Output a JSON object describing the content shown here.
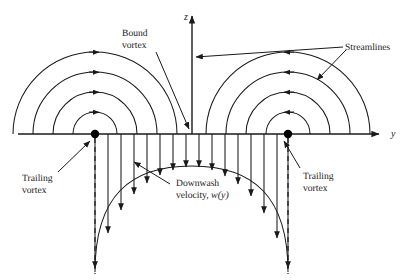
{
  "figure": {
    "background_color": "#ffffff",
    "line_color": "#1a1a1a",
    "width": 412,
    "height": 280
  },
  "axes": {
    "horizontal": {
      "name": "y-axis",
      "label": "y",
      "label_x": 391,
      "label_y": 133,
      "y": 134,
      "x_start": 18,
      "x_end": 384,
      "arrow": "right"
    },
    "vertical": {
      "name": "z-axis",
      "label": "z",
      "label_x": 186,
      "label_y": 19,
      "x": 192,
      "y_start": 134,
      "y_end": 15,
      "arrow": "up"
    }
  },
  "vortices": {
    "left": {
      "name": "left-trailing-vortex-node",
      "cx": 95,
      "cy": 134,
      "r": 4.2
    },
    "right": {
      "name": "right-trailing-vortex-node",
      "cx": 288,
      "cy": 134,
      "r": 4.2
    }
  },
  "streamline_arcs": {
    "radii": [
      22,
      42,
      62,
      82
    ],
    "arrow_direction_left": "right",
    "arrow_direction_right": "left",
    "count_per_side": 4
  },
  "trailing_vortex_dashes": {
    "left_x": 95,
    "right_x": 288,
    "y_top": 138,
    "y_bottom": 272
  },
  "downwash": {
    "arrow_count": 15,
    "x_positions": [
      95,
      108,
      121,
      134,
      147,
      160,
      173,
      186,
      199,
      212,
      225,
      238,
      251,
      264,
      277,
      288
    ],
    "curve_peak_y": 166,
    "baseline_y": 134
  },
  "labels": {
    "bound_vortex": {
      "line1": "Bound",
      "line2": "vortex",
      "x": 122,
      "y": 34
    },
    "streamlines": {
      "text": "Streamlines",
      "x": 345,
      "y": 48
    },
    "trailing_vortex_left": {
      "line1": "Trailing",
      "line2": "vortex",
      "x": 22,
      "y": 178
    },
    "trailing_vortex_right": {
      "line1": "Trailing",
      "line2": "vortex",
      "x": 303,
      "y": 176
    },
    "downwash": {
      "line1": "Downwash",
      "line2_prefix": "velocity, ",
      "line2_italic": "w(y)",
      "x": 172,
      "y": 182
    }
  }
}
